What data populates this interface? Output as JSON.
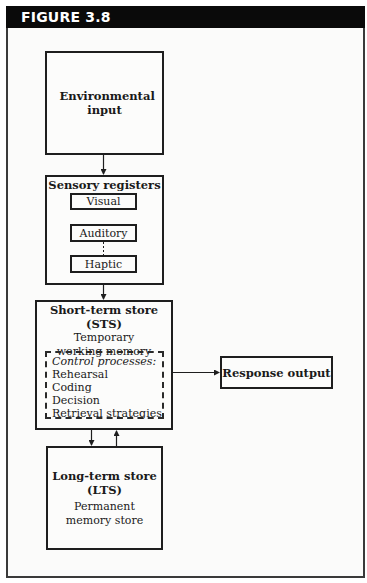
{
  "figure": {
    "label": "FIGURE 3.8"
  },
  "nodes": {
    "environmental_input": {
      "title": "Environmental input"
    },
    "sensory_registers": {
      "title": "Sensory registers",
      "channels": [
        "Visual",
        "Auditory",
        "Haptic"
      ]
    },
    "short_term_store": {
      "title": "Short-term store",
      "abbr": "(STS)",
      "subtitle_line1": "Temporary",
      "subtitle_line2": "working memory",
      "control_processes": {
        "heading": "Control processes:",
        "items": [
          "Rehearsal",
          "Coding",
          "Decision",
          "Retrieval strategies"
        ]
      }
    },
    "response_output": {
      "title": "Response output"
    },
    "long_term_store": {
      "title": "Long-term store",
      "abbr": "(LTS)",
      "subtitle_line1": "Permanent",
      "subtitle_line2": "memory store"
    }
  },
  "edges": [
    {
      "from": "Environmental input",
      "to": "Sensory registers"
    },
    {
      "from": "Sensory registers",
      "to": "Short-term store"
    },
    {
      "from": "Short-term store",
      "to": "Response output"
    },
    {
      "from": "Short-term store",
      "to": "Long-term store"
    },
    {
      "from": "Long-term store",
      "to": "Short-term store"
    }
  ]
}
